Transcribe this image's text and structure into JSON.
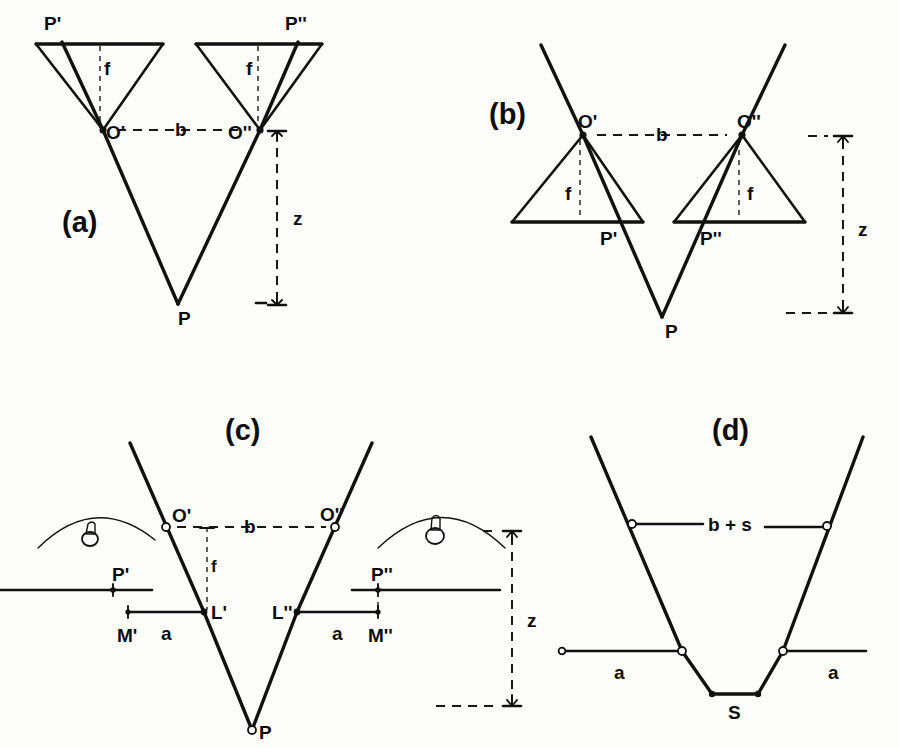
{
  "figure": {
    "background_color": "#fdfdfc",
    "ink_color": "#111111"
  },
  "panels": [
    {
      "id": "a",
      "label": "(a)",
      "description": "Inverted-triangle camera cones above, rays crossing at nodal points O' and O'' converging down to object point P",
      "points": {
        "p_left_image": "P'",
        "p_right_image": "P''",
        "node_left": "O'",
        "node_right": "O''",
        "object": "P"
      },
      "dimensions": {
        "baseline": "b",
        "focal_left": "f",
        "focal_right": "f",
        "depth": "z"
      }
    },
    {
      "id": "b",
      "label": "(b)",
      "description": "Upright-triangle camera cones below nodal points O' and O''; image points P' and P'' lie on the image planes, rays converge at object point P",
      "points": {
        "node_left": "O'",
        "node_right": "O''",
        "p_left_image": "P'",
        "p_right_image": "P''",
        "object": "P"
      },
      "dimensions": {
        "baseline": "b",
        "focal_left": "f",
        "focal_right": "f",
        "depth": "z"
      }
    },
    {
      "id": "c",
      "label": "(c)",
      "description": "Two lens/eye arcs with image planes; parallax measured from M' to L' and L'' to M''; rays converge at object point P",
      "points": {
        "node_left": "O'",
        "node_right": "O''",
        "p_left_image": "P'",
        "p_right_image": "P''",
        "mark_left": "L'",
        "mark_right": "L''",
        "measure_left": "M'",
        "measure_right": "M''",
        "object": "P"
      },
      "dimensions": {
        "baseline": "b",
        "focal": "f",
        "offset_left": "a",
        "offset_right": "a",
        "depth": "z"
      }
    },
    {
      "id": "d",
      "label": "(d)",
      "description": "Trapezoidal ray bundle: upper chord labelled b + s, lower chords labelled a on each side, converging to the short base segment S",
      "points": {
        "base": "S"
      },
      "dimensions": {
        "top_chord": "b + s",
        "offset_left": "a",
        "offset_right": "a"
      }
    }
  ],
  "labels": {
    "panel_a": "(a)",
    "panel_b": "(b)",
    "panel_c": "(c)",
    "panel_d": "(d)",
    "P_prime": "P'",
    "P_dprime": "P''",
    "O_prime": "O'",
    "O_dprime": "O''",
    "P": "P",
    "L_prime": "L'",
    "L_dprime": "L''",
    "M_prime": "M'",
    "M_dprime": "M''",
    "S": "S",
    "b": "b",
    "f": "f",
    "z": "z",
    "a": "a",
    "b_plus_s": "b + s"
  }
}
